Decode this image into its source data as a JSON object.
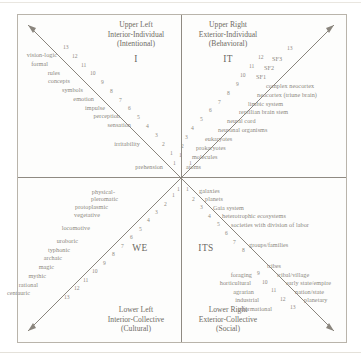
{
  "diagram": {
    "frame_color": "#b9b4ab",
    "text_color": "#8c887f",
    "line_color": "#8a857d"
  },
  "quadrants": {
    "upper_left": {
      "line1": "Upper Left",
      "line2": "Interior-Individual",
      "line3": "(Intentional)",
      "pronoun": "I"
    },
    "upper_right": {
      "line1": "Upper Right",
      "line2": "Exterior-Individual",
      "line3": "(Behavioral)",
      "pronoun": "IT"
    },
    "lower_left": {
      "line1": "Lower Left",
      "line2": "Interior-Collective",
      "line3": "(Cultural)",
      "pronoun": "WE"
    },
    "lower_right": {
      "line1": "Lower Right",
      "line2": "Exterior-Collective",
      "line3": "(Social)",
      "pronoun": "ITS"
    }
  },
  "chart_data": {
    "type": "diagram",
    "axes": [
      "Interior / Exterior",
      "Individual / Collective"
    ],
    "series": [
      {
        "name": "Upper Left (Interior-Individual)",
        "direction": "up-left",
        "labels": [
          "prehension",
          "irritability",
          "sensation",
          "perception",
          "impulse",
          "emotion",
          "symbols",
          "concepts",
          "rules",
          "formal",
          "vision-logic"
        ],
        "levels": [
          1,
          2,
          3,
          4,
          5,
          6,
          7,
          8,
          9,
          10,
          11,
          12,
          13
        ]
      },
      {
        "name": "Upper Right (Exterior-Individual)",
        "direction": "up-right",
        "labels": [
          "atoms",
          "molecules",
          "prokaryotes",
          "eukaryotes",
          "neuronal organisms",
          "neural cord",
          "reptilian brain stem",
          "limbic system",
          "neocortex (triune brain)",
          "complex neocortex",
          "SF1",
          "SF2",
          "SF3"
        ],
        "levels": [
          1,
          2,
          3,
          4,
          5,
          6,
          7,
          8,
          9,
          10,
          11,
          12,
          13
        ]
      },
      {
        "name": "Lower Left (Interior-Collective)",
        "direction": "down-left",
        "labels": [
          "physical-pleromatic",
          "protoplasmic",
          "vegetative",
          "locomotive",
          "uroboric",
          "typhonic",
          "archaic",
          "magic",
          "mythic",
          "rational",
          "centauric"
        ],
        "levels": [
          1,
          2,
          3,
          4,
          5,
          6,
          7,
          8,
          9,
          10,
          11,
          12,
          13
        ]
      },
      {
        "name": "Lower Right (Exterior-Collective)",
        "direction": "down-right",
        "labels": [
          "galaxies",
          "planets",
          "Gaia system",
          "heterotrophic ecosystems",
          "societies with division of labor",
          "groups/families",
          "tribes",
          "tribal/village",
          "early state/empire",
          "nation/state",
          "planetary"
        ],
        "stage_labels": [
          "foraging",
          "horticultural",
          "agrarian",
          "industrial",
          "informational"
        ],
        "levels": [
          1,
          2,
          3,
          4,
          5,
          6,
          7,
          8,
          9,
          10,
          11,
          12,
          13
        ]
      }
    ]
  },
  "upper_left_labels": [
    {
      "text": "vision-logic",
      "x": 57,
      "y": 51
    },
    {
      "text": "formal",
      "x": 48,
      "y": 60
    },
    {
      "text": "rules",
      "x": 60,
      "y": 69
    },
    {
      "text": "concepts",
      "x": 70,
      "y": 77
    },
    {
      "text": "symbols",
      "x": 83,
      "y": 86
    },
    {
      "text": "emotion",
      "x": 94,
      "y": 95
    },
    {
      "text": "impulse",
      "x": 105,
      "y": 104
    },
    {
      "text": "perception",
      "x": 120,
      "y": 112
    },
    {
      "text": "sensation",
      "x": 131,
      "y": 121
    },
    {
      "text": "irritability",
      "x": 140,
      "y": 140
    },
    {
      "text": "prehension",
      "x": 163,
      "y": 163
    }
  ],
  "upper_left_numbers": [
    {
      "text": "13",
      "x": 63,
      "y": 44
    },
    {
      "text": "12",
      "x": 72,
      "y": 53
    },
    {
      "text": "11",
      "x": 81,
      "y": 62
    },
    {
      "text": "10",
      "x": 90,
      "y": 70
    },
    {
      "text": "9",
      "x": 101,
      "y": 79
    },
    {
      "text": "8",
      "x": 110,
      "y": 88
    },
    {
      "text": "7",
      "x": 119,
      "y": 97
    },
    {
      "text": "6",
      "x": 128,
      "y": 105
    },
    {
      "text": "5",
      "x": 137,
      "y": 114
    },
    {
      "text": "4",
      "x": 146,
      "y": 123
    },
    {
      "text": "3",
      "x": 155,
      "y": 132
    },
    {
      "text": "2",
      "x": 162,
      "y": 141
    },
    {
      "text": "1",
      "x": 170,
      "y": 150
    },
    {
      "text": "1",
      "x": 173,
      "y": 160
    }
  ],
  "upper_right_labels": [
    {
      "text": "SF3",
      "x": 272,
      "y": 55
    },
    {
      "text": "SF2",
      "x": 264,
      "y": 64
    },
    {
      "text": "SF1",
      "x": 256,
      "y": 73
    },
    {
      "text": "complex neocortex",
      "x": 266,
      "y": 82
    },
    {
      "text": "neocortex (triune brain)",
      "x": 257,
      "y": 91
    },
    {
      "text": "limbic system",
      "x": 248,
      "y": 100
    },
    {
      "text": "reptilian brain stem",
      "x": 239,
      "y": 108
    },
    {
      "text": "neural cord",
      "x": 227,
      "y": 117
    },
    {
      "text": "neuronal organisms",
      "x": 218,
      "y": 126
    },
    {
      "text": "eukaryotes",
      "x": 205,
      "y": 135
    },
    {
      "text": "prokaryotes",
      "x": 196,
      "y": 144
    },
    {
      "text": "molecules",
      "x": 192,
      "y": 153
    },
    {
      "text": "atoms",
      "x": 186,
      "y": 163
    }
  ],
  "upper_right_numbers": [
    {
      "text": "13",
      "x": 287,
      "y": 45
    },
    {
      "text": "12",
      "x": 258,
      "y": 54
    },
    {
      "text": "11",
      "x": 249,
      "y": 63
    },
    {
      "text": "10",
      "x": 240,
      "y": 72
    },
    {
      "text": "9",
      "x": 236,
      "y": 81
    },
    {
      "text": "8",
      "x": 227,
      "y": 90
    },
    {
      "text": "7",
      "x": 218,
      "y": 99
    },
    {
      "text": "6",
      "x": 209,
      "y": 107
    },
    {
      "text": "5",
      "x": 200,
      "y": 116
    },
    {
      "text": "4",
      "x": 191,
      "y": 125
    },
    {
      "text": "3",
      "x": 185,
      "y": 134
    },
    {
      "text": "2",
      "x": 181,
      "y": 143
    },
    {
      "text": "1",
      "x": 179,
      "y": 152
    },
    {
      "text": "1",
      "x": 189,
      "y": 160
    }
  ],
  "lower_left_labels": [
    {
      "text": "physical-",
      "x": 115,
      "y": 188
    },
    {
      "text": "pleromatic",
      "x": 118,
      "y": 195
    },
    {
      "text": "protoplasmic",
      "x": 108,
      "y": 203
    },
    {
      "text": "vegetative",
      "x": 100,
      "y": 211
    },
    {
      "text": "locomotive",
      "x": 90,
      "y": 224
    },
    {
      "text": "uroboric",
      "x": 78,
      "y": 237
    },
    {
      "text": "typhonic",
      "x": 70,
      "y": 246
    },
    {
      "text": "archaic",
      "x": 62,
      "y": 254
    },
    {
      "text": "magic",
      "x": 54,
      "y": 263
    },
    {
      "text": "mythic",
      "x": 46,
      "y": 272
    },
    {
      "text": "rational",
      "x": 38,
      "y": 281
    },
    {
      "text": "centauric",
      "x": 30,
      "y": 289
    }
  ],
  "lower_left_numbers": [
    {
      "text": "1",
      "x": 172,
      "y": 192
    },
    {
      "text": "2",
      "x": 164,
      "y": 201
    },
    {
      "text": "3",
      "x": 155,
      "y": 209
    },
    {
      "text": "4",
      "x": 147,
      "y": 217
    },
    {
      "text": "5",
      "x": 139,
      "y": 226
    },
    {
      "text": "6",
      "x": 130,
      "y": 234
    },
    {
      "text": "7",
      "x": 121,
      "y": 243
    },
    {
      "text": "8",
      "x": 112,
      "y": 251
    },
    {
      "text": "9",
      "x": 103,
      "y": 260
    },
    {
      "text": "10",
      "x": 92,
      "y": 268
    },
    {
      "text": "11",
      "x": 83,
      "y": 277
    },
    {
      "text": "12",
      "x": 74,
      "y": 285
    },
    {
      "text": "13",
      "x": 64,
      "y": 294
    },
    {
      "text": "1",
      "x": 177,
      "y": 186
    }
  ],
  "lower_right_labels": [
    {
      "text": "galaxies",
      "x": 199,
      "y": 187
    },
    {
      "text": "planets",
      "x": 205,
      "y": 195
    },
    {
      "text": "Gaia system",
      "x": 213,
      "y": 204
    },
    {
      "text": "heterotrophic ecosystems",
      "x": 222,
      "y": 212
    },
    {
      "text": "societies with division of labor",
      "x": 231,
      "y": 221
    },
    {
      "text": "groups/families",
      "x": 249,
      "y": 241
    },
    {
      "text": "tribes",
      "x": 267,
      "y": 262
    },
    {
      "text": "tribal/village",
      "x": 277,
      "y": 271
    },
    {
      "text": "early state/empire",
      "x": 286,
      "y": 279
    },
    {
      "text": "nation/state",
      "x": 295,
      "y": 288
    },
    {
      "text": "planetary",
      "x": 304,
      "y": 296
    }
  ],
  "lower_right_stage_labels": [
    {
      "text": "foraging",
      "x": 252,
      "y": 271
    },
    {
      "text": "horticultural",
      "x": 251,
      "y": 279
    },
    {
      "text": "agrarian",
      "x": 254,
      "y": 288
    },
    {
      "text": "industrial",
      "x": 259,
      "y": 296
    },
    {
      "text": "informational",
      "x": 272,
      "y": 305
    }
  ],
  "lower_right_numbers": [
    {
      "text": "1",
      "x": 186,
      "y": 186
    },
    {
      "text": "2",
      "x": 192,
      "y": 196
    },
    {
      "text": "3",
      "x": 200,
      "y": 204
    },
    {
      "text": "4",
      "x": 208,
      "y": 213
    },
    {
      "text": "5",
      "x": 217,
      "y": 221
    },
    {
      "text": "6",
      "x": 225,
      "y": 230
    },
    {
      "text": "7",
      "x": 233,
      "y": 239
    },
    {
      "text": "8",
      "x": 242,
      "y": 247
    },
    {
      "text": "9",
      "x": 257,
      "y": 270
    },
    {
      "text": "10",
      "x": 262,
      "y": 279
    },
    {
      "text": "11",
      "x": 271,
      "y": 287
    },
    {
      "text": "12",
      "x": 280,
      "y": 296
    },
    {
      "text": "13",
      "x": 290,
      "y": 304
    }
  ]
}
